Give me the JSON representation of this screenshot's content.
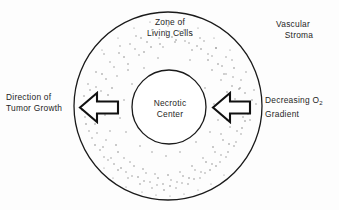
{
  "diagram": {
    "background_color": "#fdfdfd",
    "ink_color": "#1a1a1a",
    "stipple_color": "#8d8d8d",
    "outer_circle": {
      "name": "zone-of-living-cells-boundary",
      "cx": 168,
      "cy": 106,
      "r": 94,
      "stroke_width": 1.3,
      "fill": "none"
    },
    "inner_circle": {
      "name": "necrotic-center-boundary",
      "cx": 169,
      "cy": 107,
      "r": 37,
      "stroke_width": 1.3,
      "fill": "#ffffff"
    },
    "arrows": [
      {
        "name": "left-growth-arrow",
        "direction": "left",
        "x": 80,
        "y": 93,
        "width": 38,
        "height": 29
      },
      {
        "name": "right-gradient-arrow",
        "direction": "left",
        "x": 213,
        "y": 93,
        "width": 37,
        "height": 29
      }
    ]
  },
  "labels": {
    "zone_of_living_cells": {
      "line1": "Zone of",
      "line2": "Living Cells"
    },
    "vascular_stroma": {
      "line1": "Vascular",
      "line2": "Stroma"
    },
    "necrotic_center": {
      "line1": "Necrotic",
      "line2": "Center"
    },
    "direction_of_tumor_growth": {
      "line1": "Direction of",
      "line2": "Tumor Growth"
    },
    "decreasing_o2_gradient": {
      "line1_prefix": "Decreasing O",
      "line1_subscript": "2",
      "line2": "Gradient"
    }
  }
}
